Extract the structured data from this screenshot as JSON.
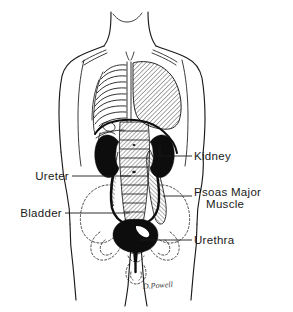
{
  "figure": {
    "artist_signature": "D.Powell",
    "background_color": "#ffffff",
    "ink_color": "#1a1a1a",
    "organ_fill_color": "#0d0d0d"
  },
  "labels": [
    {
      "id": "kidney",
      "text": "Kidney",
      "side": "right",
      "lines": [
        "Kidney"
      ]
    },
    {
      "id": "psoas-major-muscle",
      "text": "Psoas Major Muscle",
      "side": "right",
      "lines": [
        "Psoas Major",
        "Muscle"
      ]
    },
    {
      "id": "urethra",
      "text": "Urethra",
      "side": "right",
      "lines": [
        "Urethra"
      ]
    },
    {
      "id": "ureter",
      "text": "Ureter",
      "side": "left",
      "lines": [
        "Ureter"
      ]
    },
    {
      "id": "bladder",
      "text": "Bladder",
      "side": "left",
      "lines": [
        "Bladder"
      ]
    }
  ],
  "label_text": {
    "kidney": "Kidney",
    "psoas_major_line1": "Psoas Major",
    "psoas_major_line2": "Muscle",
    "urethra": "Urethra",
    "ureter": "Ureter",
    "bladder": "Bladder"
  },
  "signature": {
    "text": "D.Powell"
  }
}
